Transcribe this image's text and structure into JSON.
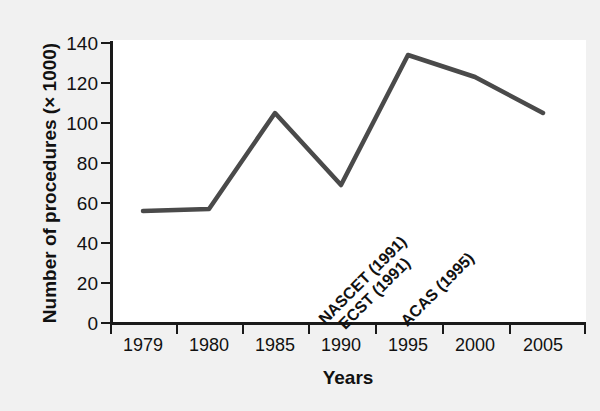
{
  "chart_data": {
    "type": "line",
    "title": "",
    "subtitle": "",
    "xlabel": "Years",
    "ylabel": "Number of procedures (× 1000)",
    "categories": [
      "1979",
      "1980",
      "1985",
      "1990",
      "1995",
      "2000",
      "2005"
    ],
    "values": [
      56,
      57,
      105,
      69,
      134,
      123,
      105
    ],
    "series": [
      {
        "name": "Number of procedures",
        "values": [
          56,
          57,
          105,
          69,
          134,
          123,
          105
        ]
      }
    ],
    "ylim": [
      0,
      140
    ],
    "yticks": [
      "0",
      "20",
      "40",
      "60",
      "80",
      "100",
      "120",
      "140"
    ],
    "xticks": [
      "1979",
      "1980",
      "1985",
      "1990",
      "1995",
      "2000",
      "2005"
    ],
    "grid": false,
    "legend": false,
    "legend_position": "none",
    "line_color": "#4a4a4a",
    "annotations": [
      {
        "label": "NASCET (1991)",
        "rotation": -45
      },
      {
        "label": "ECST (1991)",
        "rotation": -45
      },
      {
        "label": "ACAS (1995)",
        "rotation": -45
      }
    ]
  },
  "colors": {
    "background": "#f1f1f1",
    "plot_background": "#ffffff",
    "axis": "#1a1a1a",
    "text": "#111111",
    "line": "#4a4a4a"
  }
}
